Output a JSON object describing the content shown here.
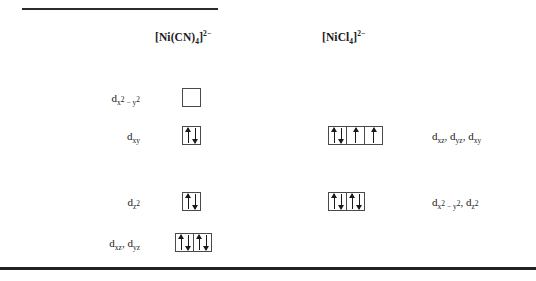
{
  "figure": {
    "columns": [
      {
        "name": "column-ni-cn",
        "header_html": "[Ni(CN)<sub>4</sub>]<sup>2&#8722;</sup>",
        "header_text": "[Ni(CN)4]2-"
      },
      {
        "name": "column-ni-cl",
        "header_html": "[NiCl<sub>4</sub>]<sup>2&#8722;</sup>",
        "header_text": "[NiCl4]2-"
      }
    ],
    "rows": [
      {
        "name": "row-dx2y2",
        "left_label_html": "d<sub>x<sup>2</sup> &#8722; y<sup>2</sup></sub>",
        "left_label_text": "dx2-y2",
        "right_label_html": "",
        "right_label_text": "",
        "left_boxes": [
          {
            "electrons": []
          }
        ],
        "right_boxes": []
      },
      {
        "name": "row-dxy",
        "left_label_html": "d<sub>xy</sub>",
        "left_label_text": "dxy",
        "right_label_html": "d<sub>xz</sub>, d<sub>yz</sub>, d<sub>xy</sub>",
        "right_label_text": "dxz, dyz, dxy",
        "left_boxes": [
          {
            "electrons": [
              "up",
              "down"
            ]
          }
        ],
        "right_boxes": [
          {
            "electrons": [
              "up",
              "down"
            ]
          },
          {
            "electrons": [
              "up"
            ]
          },
          {
            "electrons": [
              "up"
            ]
          }
        ]
      },
      {
        "name": "row-dz2",
        "left_label_html": "d<sub>z<sup>2</sup></sub>",
        "left_label_text": "dz2",
        "right_label_html": "d<sub>x<sup>2</sup> &#8722; y<sup>2</sup></sub>, d<sub>z<sup>2</sup></sub>",
        "right_label_text": "dx2-y2, dz2",
        "left_boxes": [
          {
            "electrons": [
              "up",
              "down"
            ]
          }
        ],
        "right_boxes": [
          {
            "electrons": [
              "up",
              "down"
            ]
          },
          {
            "electrons": [
              "up",
              "down"
            ]
          }
        ]
      },
      {
        "name": "row-dxz-dyz",
        "left_label_html": "d<sub>xz</sub>, d<sub>yz</sub>",
        "left_label_text": "dxz, dyz",
        "right_label_html": "",
        "right_label_text": "",
        "left_boxes": [
          {
            "electrons": [
              "up",
              "down"
            ]
          },
          {
            "electrons": [
              "up",
              "down"
            ]
          }
        ],
        "right_boxes": []
      }
    ],
    "colors": {
      "ink": "#1a1a1a",
      "rule": "#232323",
      "box_border": "#4a4a4a",
      "background": "#ffffff"
    }
  },
  "layout": {
    "row_tops": [
      85,
      123,
      189,
      230
    ],
    "left_label_right_edge": 140,
    "left_boxes_x": [
      182,
      182,
      182,
      175
    ],
    "right_boxes_x": 328,
    "right_label_x": 432
  }
}
